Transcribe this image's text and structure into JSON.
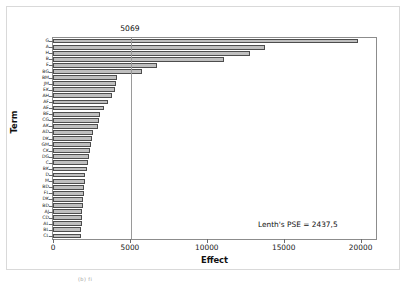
{
  "figure": {
    "caption": "(b) fi"
  },
  "chart_data": {
    "type": "bar",
    "orientation": "horizontal",
    "title": "",
    "xlabel": "Effect",
    "ylabel": "Term",
    "xlim": [
      0,
      21000
    ],
    "xticks": [
      0,
      5000,
      10000,
      15000,
      20000
    ],
    "xticklabels": [
      "0",
      "5000",
      "10000",
      "15000",
      "20000"
    ],
    "grid": false,
    "legend": null,
    "reference_line": {
      "value": 5069,
      "label": "5069"
    },
    "annotations": [
      {
        "text": "Lenth's PSE = 2437,5"
      }
    ],
    "categories": [
      "G",
      "A",
      "H",
      "B",
      "E",
      "BG",
      "BM",
      "JM",
      "EK",
      "AH",
      "AF",
      "AE",
      "BE",
      "CG",
      "AK",
      "AD",
      "DK",
      "GM",
      "CK",
      "DG",
      "C",
      "BK",
      "D",
      "M",
      "BD",
      "FL",
      "DK",
      "BD",
      "AJ",
      "CD",
      "AL",
      "BL",
      "CL"
    ],
    "values": [
      19800,
      13800,
      12800,
      11100,
      6750,
      5800,
      4180,
      4100,
      4060,
      3820,
      3600,
      3320,
      3080,
      2980,
      2900,
      2600,
      2560,
      2480,
      2420,
      2340,
      2280,
      2200,
      2100,
      2060,
      2020,
      2000,
      1960,
      1920,
      1900,
      1880,
      1860,
      1840,
      1820
    ]
  }
}
